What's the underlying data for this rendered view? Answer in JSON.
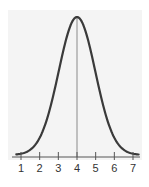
{
  "chart_data": {
    "type": "line",
    "title": "",
    "xlabel": "",
    "ylabel": "",
    "x_ticks": [
      "1",
      "2",
      "3",
      "4",
      "5",
      "6",
      "7"
    ],
    "xlim": [
      0.6,
      7.3
    ],
    "ylim": [
      0,
      1
    ],
    "grid": false,
    "legend": null,
    "mean": 4,
    "std_dev_approx": 1,
    "series": [
      {
        "name": "distribution",
        "x": [
          0.8,
          1,
          1.5,
          2,
          2.5,
          3,
          3.5,
          4,
          4.5,
          5,
          5.5,
          6,
          6.5,
          7,
          7.2
        ],
        "y": [
          0.01,
          0.02,
          0.06,
          0.17,
          0.38,
          0.62,
          0.88,
          1.0,
          0.88,
          0.62,
          0.38,
          0.17,
          0.06,
          0.02,
          0.01
        ]
      }
    ],
    "annotations": [
      {
        "type": "vertical-line",
        "x": 4,
        "label": ""
      }
    ],
    "colors": {
      "curve": "#3a3a3a",
      "mean_line": "#8a8a8a",
      "axis": "#555555",
      "panel": "#f4f4f4"
    }
  }
}
